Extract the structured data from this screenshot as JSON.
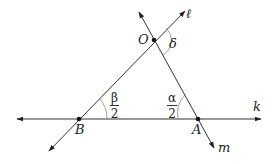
{
  "diagram": {
    "points": [
      {
        "id": "O",
        "label": "O",
        "x": 154,
        "y": 40
      },
      {
        "id": "B",
        "label": "B",
        "x": 79,
        "y": 119
      },
      {
        "id": "A",
        "label": "A",
        "x": 198,
        "y": 119
      }
    ],
    "lines": [
      {
        "id": "k",
        "label": "k",
        "description": "horizontal line through B and A"
      },
      {
        "id": "l",
        "label": "ℓ",
        "description": "line through B and O"
      },
      {
        "id": "m",
        "label": "m",
        "description": "line through O and A"
      }
    ],
    "angles": [
      {
        "id": "delta",
        "label": "δ",
        "vertex": "O",
        "description": "exterior angle at O between ℓ and m"
      },
      {
        "id": "beta_half",
        "numerator": "β",
        "denominator": "2",
        "vertex": "B",
        "description": "angle between k and ℓ at B"
      },
      {
        "id": "alpha_half",
        "numerator": "α",
        "denominator": "2",
        "vertex": "A",
        "description": "angle between k and m at A"
      }
    ],
    "colors": {
      "stroke": "#333333",
      "angle_arc": "#888888",
      "text": "#222222"
    }
  }
}
